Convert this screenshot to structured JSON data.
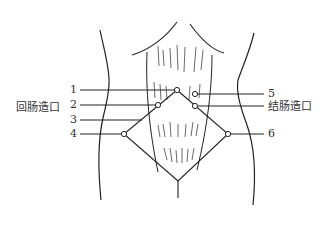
{
  "figure": {
    "left_label": "回肠造口",
    "right_label": "结肠造口",
    "markers": [
      {
        "id": "1",
        "label": "1"
      },
      {
        "id": "2",
        "label": "2"
      },
      {
        "id": "3",
        "label": "3"
      },
      {
        "id": "4",
        "label": "4"
      },
      {
        "id": "5",
        "label": "5"
      },
      {
        "id": "6",
        "label": "6"
      }
    ]
  },
  "colors": {
    "line": "#222222",
    "text": "#333333",
    "background": "#ffffff"
  }
}
